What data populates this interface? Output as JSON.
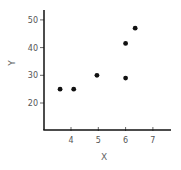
{
  "chart_data": {
    "type": "scatter",
    "title": "",
    "xlabel": "X",
    "ylabel": "Y",
    "xlim": [
      3.0,
      7.7
    ],
    "ylim": [
      10,
      54
    ],
    "xticks": [
      4,
      5,
      6,
      7
    ],
    "yticks": [
      20,
      30,
      40,
      50
    ],
    "xtick_labels": [
      "4",
      "5",
      "6",
      "7"
    ],
    "ytick_labels": [
      "20",
      "30",
      "40",
      "50"
    ],
    "grid": false,
    "legend": null,
    "series": [
      {
        "name": "data",
        "color": "#111111",
        "points": [
          {
            "x": 3.6,
            "y": 25
          },
          {
            "x": 4.1,
            "y": 25
          },
          {
            "x": 4.95,
            "y": 30
          },
          {
            "x": 6.0,
            "y": 29
          },
          {
            "x": 6.0,
            "y": 41.5
          },
          {
            "x": 6.35,
            "y": 47
          }
        ]
      }
    ]
  },
  "layout": {
    "axis_color": "#111111",
    "tick_color": "#666666"
  }
}
